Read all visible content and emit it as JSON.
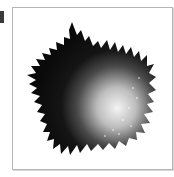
{
  "image": {
    "subject": "fractal-shaded-pentagon",
    "description": "Dark fractal-edged polygon (Koch-like snowflake border) with a radial gray-to-white shading",
    "colors": {
      "dark": "#111111",
      "light": "#f2f2f2",
      "frame_border": "#b5b5b5",
      "background": "#ffffff"
    }
  }
}
